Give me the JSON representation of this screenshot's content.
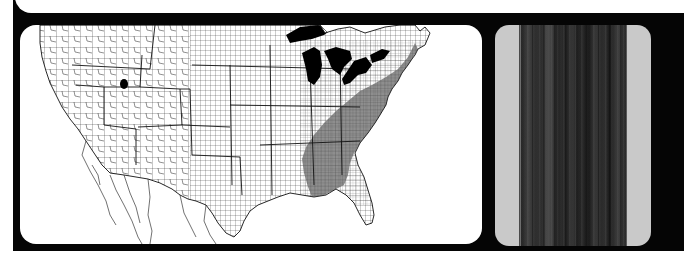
{
  "figure": {
    "panels": [
      {
        "id": "range-map",
        "type": "county-level range map",
        "region": "Contiguous United States",
        "legend": [],
        "shading": {
          "range_color": "#7a7a7a",
          "background_color": "#ffffff",
          "water_color": "#000000",
          "border_color": "#111111"
        },
        "shaded_region": "Eastern United States (Appalachians, Piedmont, Ohio Valley, Mid-Atlantic, Northeast)",
        "disjunct_points": [
          "Utah (single county)",
          "South Florida (single county)"
        ]
      },
      {
        "id": "bark-photo",
        "type": "photograph",
        "subject": "tree bark (trunk)",
        "background_color": "#c9c9c9"
      }
    ],
    "colors": {
      "frame": "#050505",
      "page": "#ffffff"
    }
  }
}
